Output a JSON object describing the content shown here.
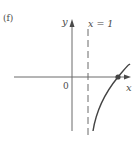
{
  "figure": {
    "panel_label": "(f)",
    "axes": {
      "x_label": "x",
      "y_label": "y",
      "origin_label": "0"
    },
    "asymptote": {
      "label": "x = 1",
      "style": "dashed",
      "orientation": "vertical"
    },
    "curve": {
      "description": "increasing curve approaching vertical asymptote x = 1 from the right, crossing the x-axis at a marked point",
      "marked_point": "x-intercept"
    },
    "colors": {
      "axis": "#555555",
      "curve": "#444444",
      "text": "#4a4a4a",
      "point": "#444444"
    }
  }
}
